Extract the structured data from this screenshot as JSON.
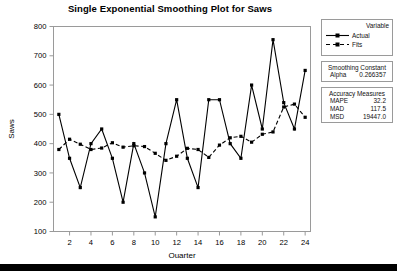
{
  "chart_data": {
    "type": "line",
    "title": "Single Exponential Smoothing Plot for Saws",
    "xlabel": "Quarter",
    "ylabel": "Saws",
    "grid": false,
    "xlim": [
      0.5,
      24.5
    ],
    "ylim": [
      100,
      800
    ],
    "xticks": [
      2,
      4,
      6,
      8,
      10,
      12,
      14,
      16,
      18,
      20,
      22,
      24
    ],
    "yticks": [
      100,
      200,
      300,
      400,
      500,
      600,
      700,
      800
    ],
    "x": [
      1,
      2,
      3,
      4,
      5,
      6,
      7,
      8,
      9,
      10,
      11,
      12,
      13,
      14,
      15,
      16,
      17,
      18,
      19,
      20,
      21,
      22,
      23,
      24
    ],
    "series": [
      {
        "name": "Actual",
        "style": "solid",
        "marker": "filled-square",
        "values": [
          500,
          350,
          250,
          400,
          450,
          350,
          200,
          400,
          300,
          150,
          400,
          550,
          350,
          250,
          550,
          550,
          400,
          350,
          600,
          450,
          755,
          540,
          450,
          650
        ]
      },
      {
        "name": "Fits",
        "style": "dashed",
        "marker": "filled-square",
        "values": [
          380,
          415,
          398,
          380,
          385,
          403,
          388,
          393,
          390,
          367,
          343,
          357,
          384,
          380,
          353,
          395,
          420,
          425,
          405,
          432,
          440,
          525,
          535,
          490
        ]
      }
    ],
    "legend_position": "right",
    "legend_title": "Variable",
    "annotations": {
      "smoothing_constant_title": "Smoothing Constant",
      "alpha_label": "Alpha",
      "alpha_value": "0.266357",
      "accuracy_title": "Accuracy Measures",
      "measures": [
        {
          "name": "MAPE",
          "value": "32.2"
        },
        {
          "name": "MAD",
          "value": "117.5"
        },
        {
          "name": "MSD",
          "value": "19447.0"
        }
      ]
    }
  },
  "colors": {
    "line": "#000000",
    "frame": "#9a9a9a",
    "text": "#000000",
    "background": "#ffffff",
    "bottom_bar": "#000000"
  }
}
